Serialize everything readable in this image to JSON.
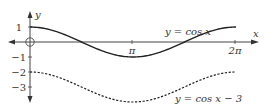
{
  "chart_data": {
    "type": "line",
    "title": "",
    "xlabel": "x",
    "ylabel": "y",
    "xlim": [
      -0.7,
      7.0
    ],
    "ylim": [
      -4,
      2
    ],
    "grid": false,
    "x_ticks": [
      {
        "value": 3.14159,
        "label": "π"
      },
      {
        "value": 6.28318,
        "label": "2π"
      }
    ],
    "y_ticks": [
      {
        "value": 1,
        "label": "1"
      },
      {
        "value": -1,
        "label": "−1"
      },
      {
        "value": -2,
        "label": "−2"
      },
      {
        "value": -3,
        "label": "−3"
      }
    ],
    "origin_marker": "circle",
    "series": [
      {
        "name": "y = cos x",
        "style": "solid",
        "x": [
          0,
          0.785,
          1.571,
          2.356,
          3.142,
          3.927,
          4.712,
          5.498,
          6.283
        ],
        "values": [
          1,
          0.707,
          0,
          -0.707,
          -1,
          -0.707,
          0,
          0.707,
          1
        ]
      },
      {
        "name": "y = cos x − 3",
        "style": "dashed",
        "x": [
          0,
          0.785,
          1.571,
          2.356,
          3.142,
          3.927,
          4.712,
          5.498,
          6.283
        ],
        "values": [
          -2,
          -2.293,
          -3,
          -3.707,
          -4,
          -3.707,
          -3,
          -2.293,
          -2
        ]
      }
    ],
    "annotations": [
      {
        "text": "y = cos x",
        "near_series": 0
      },
      {
        "text": "y = cos x − 3",
        "near_series": 1
      }
    ]
  },
  "labels": {
    "x_axis": "x",
    "y_axis": "y",
    "pi": "π",
    "two_pi": "2π",
    "y1": "1",
    "ym1": "−1",
    "ym2": "−2",
    "ym3": "−3",
    "curve1": "y = cos x",
    "curve2": "y = cos x − 3"
  },
  "colors": {
    "axis": "#333333",
    "curve": "#222222"
  }
}
